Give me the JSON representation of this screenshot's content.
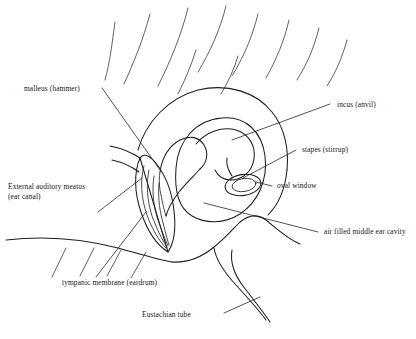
{
  "diagram": {
    "background_color": "#ffffff",
    "line_color": "#1d1d1f",
    "style": "black-and-white line drawing"
  },
  "labels": {
    "malleus": "malleus (hammer)",
    "incus": "incus (anvil)",
    "stapes": "stapes (stirrup)",
    "oval_window": "oval window",
    "air_cavity": "air filled middle ear cavity",
    "ear_canal_line1": "External auditory meatus",
    "ear_canal_line2": "(ear canal)",
    "tympanic_membrane": "tympanic membrane (eardrum)",
    "eustachian_tube": "Eustachian tube"
  },
  "parts": [
    {
      "id": "malleus",
      "name": "malleus (hammer)",
      "side": "left"
    },
    {
      "id": "ear-canal",
      "name": "External auditory meatus (ear canal)",
      "side": "left"
    },
    {
      "id": "tympanic-membrane",
      "name": "tympanic membrane (eardrum)",
      "side": "bottom"
    },
    {
      "id": "eustachian-tube",
      "name": "Eustachian tube",
      "side": "bottom"
    },
    {
      "id": "incus",
      "name": "incus (anvil)",
      "side": "right"
    },
    {
      "id": "stapes",
      "name": "stapes (stirrup)",
      "side": "right"
    },
    {
      "id": "oval-window",
      "name": "oval window",
      "side": "right"
    },
    {
      "id": "air-cavity",
      "name": "air filled middle ear cavity",
      "side": "right"
    }
  ]
}
